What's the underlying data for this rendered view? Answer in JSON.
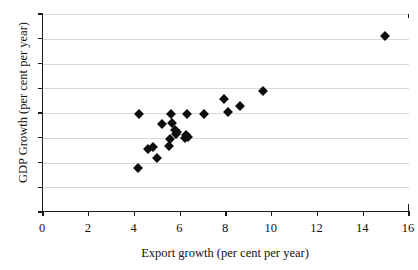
{
  "chart_data": {
    "type": "scatter",
    "title": "",
    "xlabel": "Export growth (per cent per year)",
    "ylabel": "GDP Growth (per cent per year)",
    "xlim": [
      0,
      16
    ],
    "ylim": [
      0,
      8
    ],
    "xticks": [
      0,
      2,
      4,
      6,
      8,
      10,
      12,
      14,
      16
    ],
    "yticks": [
      0,
      1,
      2,
      3,
      4,
      5,
      6,
      7,
      8
    ],
    "grid": "horizontal",
    "legend": "none",
    "marker": "diamond",
    "marker_color": "#0d0d0d",
    "grid_color": "#d9d9d9",
    "axis_color": "#1a1a1a",
    "points": [
      {
        "x": 4.15,
        "y": 1.78
      },
      {
        "x": 4.2,
        "y": 3.95
      },
      {
        "x": 4.6,
        "y": 2.55
      },
      {
        "x": 4.8,
        "y": 2.62
      },
      {
        "x": 5.0,
        "y": 2.2
      },
      {
        "x": 5.2,
        "y": 3.55
      },
      {
        "x": 5.5,
        "y": 2.65
      },
      {
        "x": 5.55,
        "y": 2.95
      },
      {
        "x": 5.6,
        "y": 3.95
      },
      {
        "x": 5.65,
        "y": 3.6
      },
      {
        "x": 5.75,
        "y": 3.3
      },
      {
        "x": 5.8,
        "y": 3.15
      },
      {
        "x": 5.85,
        "y": 3.22
      },
      {
        "x": 6.2,
        "y": 3.0
      },
      {
        "x": 6.25,
        "y": 3.1
      },
      {
        "x": 6.3,
        "y": 3.95
      },
      {
        "x": 6.35,
        "y": 3.05
      },
      {
        "x": 7.05,
        "y": 3.95
      },
      {
        "x": 7.9,
        "y": 4.55
      },
      {
        "x": 8.1,
        "y": 4.05
      },
      {
        "x": 8.6,
        "y": 4.3
      },
      {
        "x": 9.6,
        "y": 4.9
      },
      {
        "x": 14.95,
        "y": 7.1
      }
    ]
  }
}
